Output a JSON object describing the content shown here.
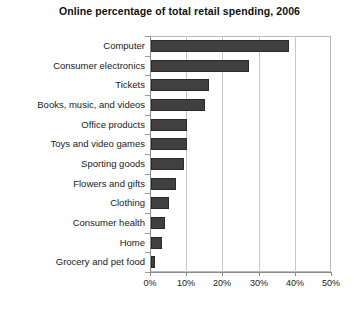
{
  "chart_data": {
    "type": "bar",
    "orientation": "horizontal",
    "title": "Online percentage of total retail spending, 2006",
    "xlabel": "",
    "ylabel": "",
    "categories": [
      "Computer",
      "Consumer electronics",
      "Tickets",
      "Books, music, and videos",
      "Office products",
      "Toys and video games",
      "Sporting goods",
      "Flowers and gifts",
      "Clothing",
      "Consumer health",
      "Home",
      "Grocery and pet food"
    ],
    "values": [
      38,
      27,
      16,
      15,
      10,
      10,
      9,
      7,
      5,
      4,
      3,
      1
    ],
    "xlim": [
      0,
      50
    ],
    "xticks": [
      0,
      10,
      20,
      30,
      40,
      50
    ],
    "xtick_labels": [
      "0%",
      "10%",
      "20%",
      "30%",
      "40%",
      "50%"
    ],
    "grid": true,
    "grid_axis": "x",
    "legend": false,
    "bar_color": "#404040",
    "bar_edge_color": "#2a2a2a",
    "background_color": "#ffffff",
    "axis_color": "#8a8a8a",
    "grid_color": "#c9c9c9"
  }
}
